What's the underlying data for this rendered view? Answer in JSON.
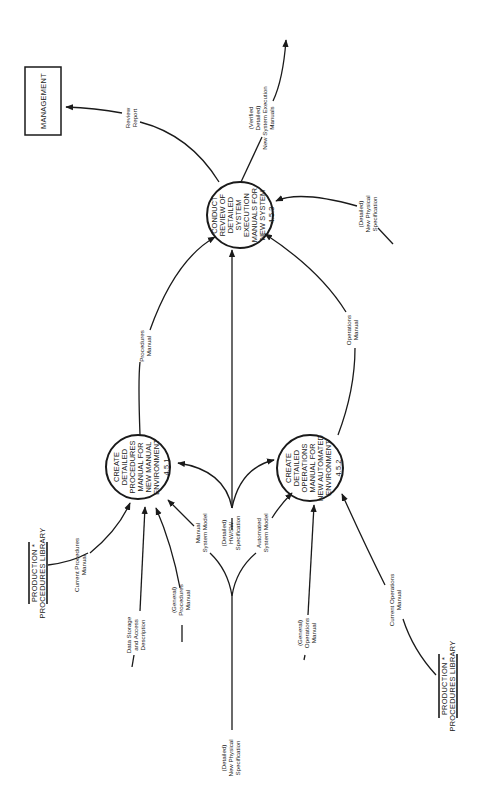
{
  "diagram": {
    "type": "data-flow-diagram",
    "orientation": "rotated -90deg",
    "colors": {
      "ink": "#1a1a1a",
      "background": "#ffffff"
    },
    "entities": {
      "management": {
        "label": "MANAGEMENT"
      },
      "library_top": {
        "line1": "PRODUCTION  *",
        "line2": "PROCEDURES LIBRARY"
      },
      "library_bottom": {
        "line1": "PRODUCTION  *",
        "line2": "PROCEDURES LIBRARY"
      }
    },
    "processes": {
      "p451": {
        "lines": [
          "CREATE",
          "DETAILED",
          "PROCEDURES",
          "MANUAL FOR",
          "NEW MANUAL",
          "ENVIRONMENT"
        ],
        "number": "4.5.1"
      },
      "p452": {
        "lines": [
          "CREATE",
          "DETAILED",
          "OPERATIONS",
          "MANUAL FOR",
          "NEW AUTOMATED",
          "ENVIRONMENT"
        ],
        "number": "4.5.2"
      },
      "p453": {
        "lines": [
          "CONDUCT",
          "REVIEW OF",
          "DETAILED",
          "SYSTEM",
          "EXECUTION",
          "MANUALS FOR",
          "NEW SYSTEM"
        ],
        "number": "4.5.3"
      }
    },
    "flows": {
      "review_report": {
        "lines": [
          "Review",
          "Report"
        ]
      },
      "verified_manuals": {
        "lines": [
          "(Verified",
          "Detailed)",
          "New System Execution",
          "Manuals"
        ]
      },
      "new_phys_spec_453": {
        "lines": [
          "(Detailed)",
          "New Physical",
          "Specification"
        ]
      },
      "procedures_manual": {
        "lines": [
          "Procedures",
          "Manual"
        ]
      },
      "operations_manual": {
        "lines": [
          "Operations",
          "Manual"
        ]
      },
      "hw_sw_spec": {
        "lines": [
          "(Detailed)",
          "HW/SW",
          "Specification"
        ]
      },
      "manual_system_model": {
        "lines": [
          "Manual",
          "System Model"
        ]
      },
      "automated_system_model": {
        "lines": [
          "Automated",
          "System Model"
        ]
      },
      "current_procedures_manual": {
        "lines": [
          "Current Procedures",
          "Manual"
        ]
      },
      "data_storage": {
        "lines": [
          "Data Storage",
          "and Access",
          "Description"
        ]
      },
      "general_procedures_manual": {
        "lines": [
          "(General)",
          "Procedures",
          "Manual"
        ]
      },
      "general_operations_manual": {
        "lines": [
          "(General)",
          "Operations",
          "Manual"
        ]
      },
      "current_operations_manual": {
        "lines": [
          "Current Operations",
          "Manual"
        ]
      },
      "new_phys_spec_bottom": {
        "lines": [
          "(Detailed)",
          "New Physical",
          "Specification"
        ]
      }
    }
  }
}
